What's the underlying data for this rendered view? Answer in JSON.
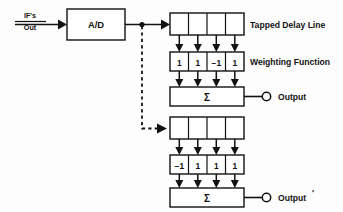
{
  "diagram": {
    "background": "#fdfdfd",
    "ink": "#121212",
    "source": {
      "line1": "IF's",
      "line2": "Out"
    },
    "converter": {
      "label": "A/D"
    },
    "labels": {
      "tapped_delay_line": "Tapped Delay Line",
      "weighting_function": "Weighting Function",
      "sigma": "Σ",
      "output_top": "Output",
      "output_bottom": "Output",
      "output_bottom_prime": "′"
    },
    "channels": [
      {
        "name": "top-channel",
        "delay_line_taps": [
          "",
          "",
          "",
          ""
        ],
        "weights": [
          "1",
          "1",
          "−1",
          "1"
        ],
        "summer": "Σ",
        "output": "Output"
      },
      {
        "name": "bottom-channel",
        "delay_line_taps": [
          "",
          "",
          "",
          ""
        ],
        "weights": [
          "−1",
          "1",
          "1",
          "1"
        ],
        "summer": "Σ",
        "output": "Output′"
      }
    ]
  }
}
